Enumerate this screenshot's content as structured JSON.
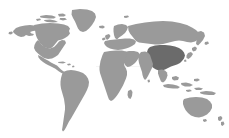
{
  "figure": {
    "name": "world-map",
    "type": "choropleth-world-map",
    "width": 229,
    "height": 138,
    "background_color": "#ffffff",
    "projection": "equirectangular",
    "title": "",
    "caption": "",
    "labels_visible": false,
    "legend_visible": false,
    "border_visible": false
  },
  "chart_data": {
    "type": "map",
    "title": "",
    "xlabel": "",
    "ylabel": "",
    "legend": [],
    "grid": false,
    "colors": {
      "background": "#ffffff",
      "land_default": "#9a9a9a",
      "land_highlight": "#6b6b6b",
      "graticule": "#d9d9d9"
    },
    "highlighted_regions": [
      {
        "name": "China",
        "color": "#6b6b6b",
        "value": "highlighted"
      }
    ],
    "default_regions": [
      {
        "name": "North America",
        "color": "#9a9a9a"
      },
      {
        "name": "Greenland",
        "color": "#9a9a9a"
      },
      {
        "name": "South America",
        "color": "#9a9a9a"
      },
      {
        "name": "Europe",
        "color": "#9a9a9a"
      },
      {
        "name": "Africa",
        "color": "#9a9a9a"
      },
      {
        "name": "Russia and Northern Asia",
        "color": "#9a9a9a"
      },
      {
        "name": "Middle East and South Asia",
        "color": "#9a9a9a"
      },
      {
        "name": "Southeast Asia and Indonesia",
        "color": "#9a9a9a"
      },
      {
        "name": "Japan",
        "color": "#9a9a9a"
      },
      {
        "name": "Australia",
        "color": "#9a9a9a"
      },
      {
        "name": "New Zealand",
        "color": "#9a9a9a"
      },
      {
        "name": "United Kingdom and Ireland",
        "color": "#9a9a9a"
      },
      {
        "name": "Madagascar",
        "color": "#9a9a9a"
      },
      {
        "name": "Caribbean and Central America",
        "color": "#9a9a9a"
      }
    ]
  }
}
